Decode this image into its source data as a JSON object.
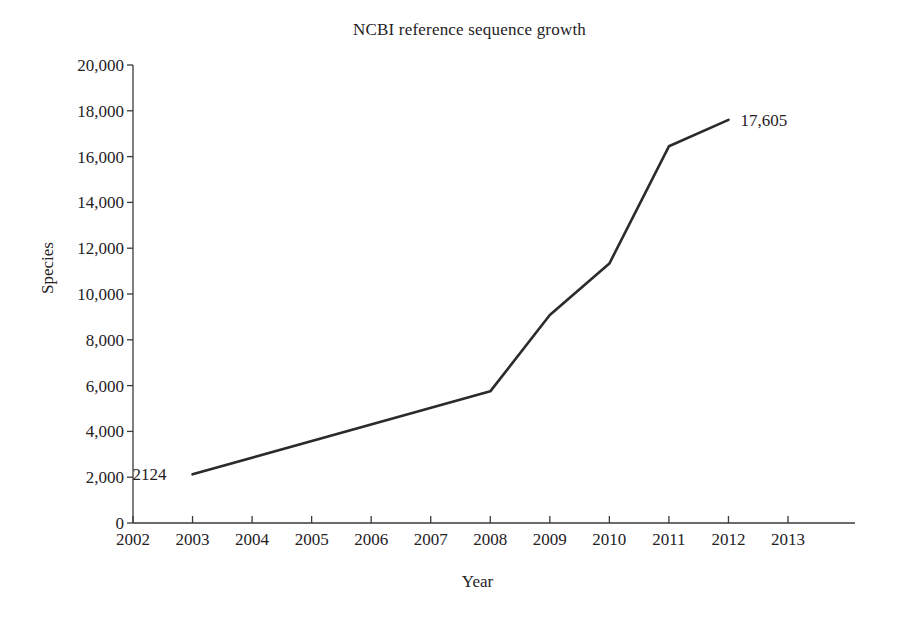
{
  "chart_data": {
    "type": "line",
    "title": "NCBI reference sequence growth",
    "xlabel": "Year",
    "ylabel": "Species",
    "grid": false,
    "legend": false,
    "xlim": [
      2002,
      2013
    ],
    "ylim": [
      0,
      20000
    ],
    "x_ticks": [
      "2002",
      "2003",
      "2004",
      "2005",
      "2006",
      "2007",
      "2008",
      "2009",
      "2010",
      "2011",
      "2012",
      "2013"
    ],
    "y_ticks": [
      "0",
      "2,000",
      "4,000",
      "6,000",
      "8,000",
      "10,000",
      "12,000",
      "14,000",
      "16,000",
      "18,000",
      "20,000"
    ],
    "y_tick_values": [
      0,
      2000,
      4000,
      6000,
      8000,
      10000,
      12000,
      14000,
      16000,
      18000,
      20000
    ],
    "series": [
      {
        "name": "Species",
        "color": "#2b2b2b",
        "x": [
          2003,
          2008,
          2009,
          2010,
          2011,
          2012
        ],
        "values": [
          2124,
          5750,
          9080,
          11330,
          16450,
          17605
        ]
      }
    ],
    "annotations": [
      {
        "text": "2124",
        "x": 2003,
        "y": 2124,
        "position": "left"
      },
      {
        "text": "17,605",
        "x": 2012,
        "y": 17605,
        "position": "right"
      }
    ]
  },
  "axis": {
    "y_label": "Species",
    "x_label": "Year"
  },
  "labels": {
    "start_point": "2124",
    "end_point": "17,605"
  },
  "colors": {
    "line": "#2b2b2b",
    "axis": "#3a3a3a",
    "text": "#25211f",
    "background": "#ffffff"
  }
}
